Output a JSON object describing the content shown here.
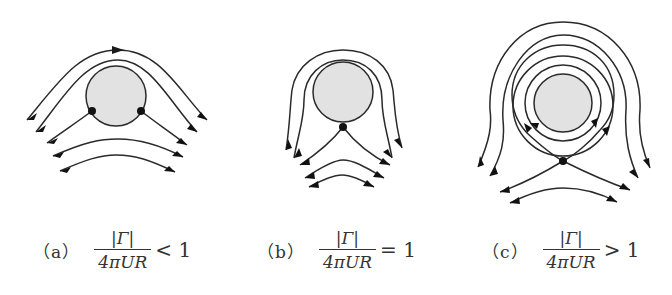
{
  "figure": {
    "panels": [
      {
        "id": "a",
        "label": "（a）",
        "numerator": "|Γ|",
        "denominator": "4πUR",
        "relation": "< 1",
        "stagnation_points": 2,
        "stagnation_location": "on cylinder surface, lower half"
      },
      {
        "id": "b",
        "label": "（b）",
        "numerator": "|Γ|",
        "denominator": "4πUR",
        "relation": "= 1",
        "stagnation_points": 1,
        "stagnation_location": "bottom of cylinder surface"
      },
      {
        "id": "c",
        "label": "（c）",
        "numerator": "|Γ|",
        "denominator": "4πUR",
        "relation": "> 1",
        "stagnation_points": 1,
        "stagnation_location": "in the flow below the cylinder"
      }
    ],
    "colors": {
      "cylinder_fill": "#e2e2e2",
      "stroke": "#2a2a2a",
      "stagnation": "#111111"
    }
  }
}
